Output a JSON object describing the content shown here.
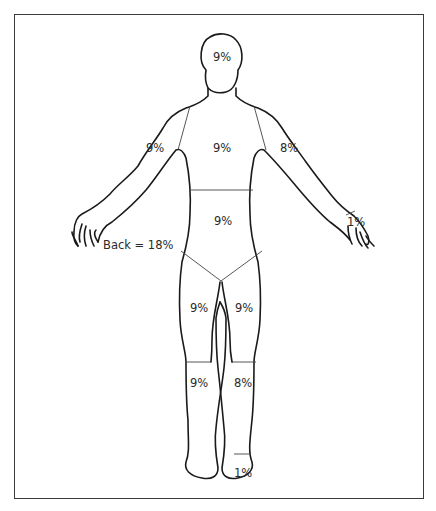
{
  "diagram": {
    "type": "rule-of-nines body surface area chart",
    "regions": {
      "head": "9%",
      "chest": "9%",
      "right_upper_arm": "9%",
      "left_upper_arm": "8%",
      "left_hand": "1%",
      "abdomen": "9%",
      "right_thigh": "9%",
      "left_thigh": "9%",
      "right_lower_leg": "9%",
      "left_lower_leg": "8%",
      "left_foot": "1%"
    },
    "back_note": "Back = 18%"
  }
}
